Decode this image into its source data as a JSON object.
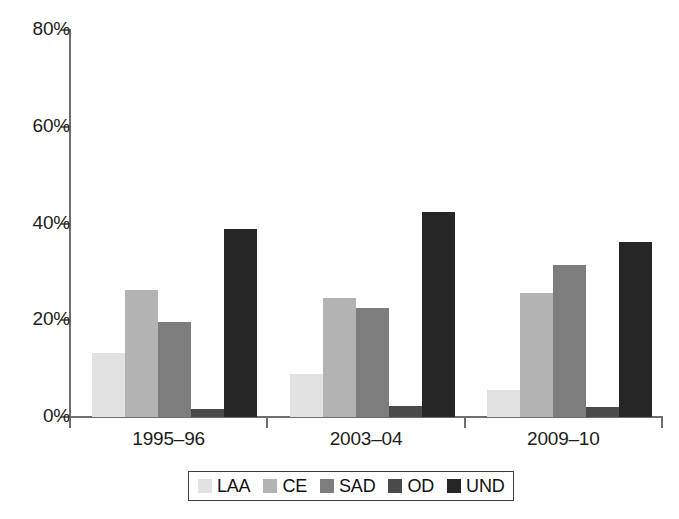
{
  "chart_data": {
    "type": "bar",
    "title": "",
    "subtitle": "",
    "xlabel": "",
    "ylabel": "",
    "categories": [
      "1995–96",
      "2003–04",
      "2009–10"
    ],
    "series": [
      {
        "name": "LAA",
        "color": "#e2e2e2",
        "values": [
          13.3,
          8.8,
          5.5
        ]
      },
      {
        "name": "CE",
        "color": "#b3b3b3",
        "values": [
          26.3,
          24.6,
          25.7
        ]
      },
      {
        "name": "SAD",
        "color": "#7d7d7d",
        "values": [
          19.6,
          22.6,
          31.4
        ]
      },
      {
        "name": "OD",
        "color": "#4a4a4a",
        "values": [
          1.7,
          2.2,
          2.0
        ]
      },
      {
        "name": "UND",
        "color": "#262626",
        "values": [
          38.8,
          42.3,
          36.2
        ]
      }
    ],
    "ylim": [
      0,
      80
    ],
    "yticks": [
      0,
      20,
      40,
      60,
      80
    ],
    "ytick_labels": [
      "0%",
      "20%",
      "40%",
      "60%",
      "80%"
    ],
    "grid": false,
    "legend_position": "bottom",
    "axis_color": "#6e6e6e"
  },
  "axis": {
    "y_labels": [
      "80%",
      "60%",
      "40%",
      "20%",
      "0%"
    ]
  },
  "legend": {
    "items": [
      {
        "label": "LAA"
      },
      {
        "label": "CE"
      },
      {
        "label": "SAD"
      },
      {
        "label": "OD"
      },
      {
        "label": "UND"
      }
    ]
  }
}
